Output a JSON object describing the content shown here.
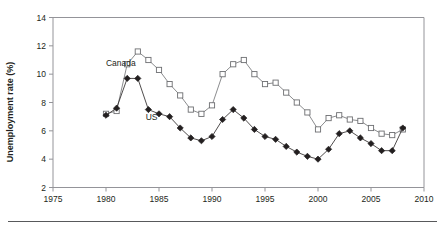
{
  "chart_data": {
    "type": "line",
    "title": "",
    "xlabel": "",
    "ylabel": "Unemployment rate (%)",
    "xlim": [
      1975,
      2010
    ],
    "ylim": [
      2,
      14
    ],
    "xticks": [
      1975,
      1980,
      1985,
      1990,
      1995,
      2000,
      2005,
      2010
    ],
    "yticks": [
      2,
      4,
      6,
      8,
      10,
      12,
      14
    ],
    "grid": false,
    "legend_position": "inline-annotation",
    "x": [
      1980,
      1981,
      1982,
      1983,
      1984,
      1985,
      1986,
      1987,
      1988,
      1989,
      1990,
      1991,
      1992,
      1993,
      1994,
      1995,
      1996,
      1997,
      1998,
      1999,
      2000,
      2001,
      2002,
      2003,
      2004,
      2005,
      2006,
      2007,
      2008
    ],
    "series": [
      {
        "name": "Canada",
        "marker": "open-square",
        "color": "#6d6e71",
        "values": [
          7.2,
          7.4,
          10.7,
          11.6,
          11.0,
          10.3,
          9.3,
          8.5,
          7.5,
          7.2,
          7.8,
          10.0,
          10.7,
          11.0,
          10.0,
          9.3,
          9.4,
          8.7,
          8.0,
          7.3,
          6.1,
          6.9,
          7.1,
          6.8,
          6.7,
          6.2,
          5.8,
          5.7,
          6.1
        ]
      },
      {
        "name": "US",
        "marker": "filled-diamond",
        "color": "#231f20",
        "values": [
          7.1,
          7.6,
          9.7,
          9.7,
          7.5,
          7.2,
          7.0,
          6.2,
          5.5,
          5.3,
          5.6,
          6.8,
          7.5,
          6.9,
          6.1,
          5.6,
          5.4,
          4.9,
          4.5,
          4.2,
          4.0,
          4.7,
          5.8,
          6.0,
          5.5,
          5.1,
          4.6,
          4.6,
          6.2
        ]
      }
    ],
    "annotations": [
      {
        "text": "Canada",
        "x": 1981.4,
        "y": 10.6
      },
      {
        "text": "US",
        "x": 1984.3,
        "y": 6.8
      }
    ]
  },
  "axis": {
    "y_title": "Unemployment rate (%)",
    "y_tick_labels": [
      "14",
      "12",
      "10",
      "8",
      "6",
      "4",
      "2"
    ],
    "x_tick_labels": [
      "1975",
      "1980",
      "1985",
      "1990",
      "1995",
      "2000",
      "2005",
      "2010"
    ]
  },
  "labels": {
    "canada": "Canada",
    "us": "US"
  }
}
